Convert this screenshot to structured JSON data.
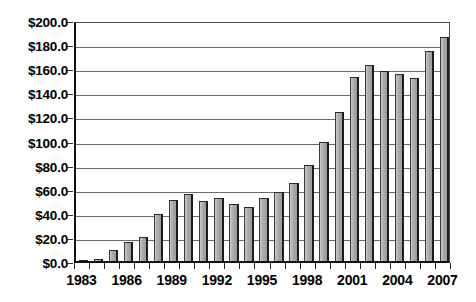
{
  "chart_data": {
    "type": "bar",
    "title": "",
    "subtitle": "",
    "xlabel": "",
    "ylabel": "",
    "categories": [
      "1983",
      "1984",
      "1985",
      "1986",
      "1987",
      "1988",
      "1989",
      "1990",
      "1991",
      "1992",
      "1993",
      "1994",
      "1995",
      "1996",
      "1997",
      "1998",
      "1999",
      "2000",
      "2001",
      "2002",
      "2003",
      "2004",
      "2005",
      "2006",
      "2007"
    ],
    "values": [
      1.0,
      2.0,
      9.0,
      16.0,
      20.0,
      39.0,
      51.0,
      56.0,
      50.0,
      52.0,
      47.0,
      45.0,
      52.0,
      57.0,
      65.0,
      80.0,
      99.0,
      124.0,
      153.0,
      163.0,
      158.0,
      155.0,
      152.0,
      174.0,
      186.0
    ],
    "value_prefix": "$",
    "ylim": [
      0,
      200
    ],
    "y_ticks": [
      0,
      20,
      40,
      60,
      80,
      100,
      120,
      140,
      160,
      180,
      200
    ],
    "y_tick_labels": [
      "$0.0",
      "$20.0",
      "$40.0",
      "$60.0",
      "$80.0",
      "$100.0",
      "$120.0",
      "$140.0",
      "$160.0",
      "$180.0",
      "$200.0"
    ],
    "x_tick_labels": [
      "1983",
      "1986",
      "1989",
      "1992",
      "1995",
      "1998",
      "2001",
      "2004",
      "2007"
    ],
    "x_tick_label_indices": [
      0,
      3,
      6,
      9,
      12,
      15,
      18,
      21,
      24
    ],
    "grid": true,
    "grid_axis": "y",
    "legend": false,
    "legend_position": "none",
    "bar_color": "#a9a9a9",
    "bar_edge_color": "#1c1c1c",
    "grid_color": "#6b6b6b",
    "axis_color": "#111111",
    "background_color": "#ffffff",
    "series_count": 1,
    "bar_count": 25
  }
}
